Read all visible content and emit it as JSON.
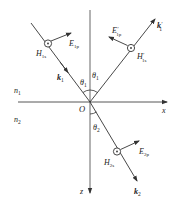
{
  "diagram": {
    "media": {
      "upper": "n",
      "upper_sub": "1",
      "lower": "n",
      "lower_sub": "2"
    },
    "axes": {
      "x": "x",
      "z": "z",
      "origin": "O"
    },
    "angles": {
      "incident": {
        "sym": "θ",
        "sub": "1"
      },
      "reflected": {
        "sym": "θ",
        "sub": "1"
      },
      "refracted": {
        "sym": "θ",
        "sub": "2"
      }
    },
    "incident": {
      "k": {
        "sym": "k",
        "sub": "1"
      },
      "E": {
        "sym": "E",
        "sub": "1p"
      },
      "H": {
        "sym": "H",
        "sub": "1s"
      }
    },
    "reflected": {
      "k": {
        "sym": "k",
        "prime": "′",
        "sub": "1"
      },
      "E": {
        "sym": "E",
        "prime": "′",
        "sub": "1p"
      },
      "H": {
        "sym": "H",
        "prime": "′",
        "sub": "1s"
      }
    },
    "transmitted": {
      "k": {
        "sym": "k",
        "sub": "2"
      },
      "E": {
        "sym": "E",
        "sub": "2p"
      },
      "H": {
        "sym": "H",
        "sub": "2s"
      }
    },
    "colors": {
      "line": "#333333",
      "text": "#222222"
    }
  }
}
